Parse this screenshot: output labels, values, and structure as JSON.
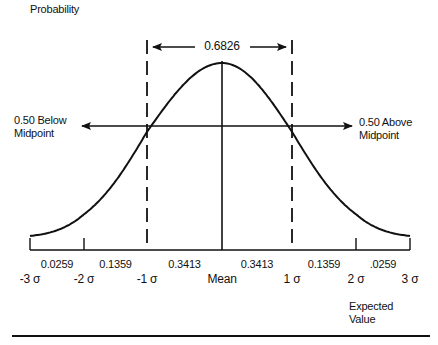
{
  "diagram": {
    "y_axis_label": "Probability",
    "x_axis_label_line1": "Expected",
    "x_axis_label_line2": "Value",
    "top_span_label": "0.6826",
    "left_annotation_line1": "0.50 Below",
    "left_annotation_line2": "Midpoint",
    "right_annotation_line1": "0.50 Above",
    "right_annotation_line2": "Midpoint",
    "stroke_color": "#111111",
    "background_color": "#ffffff"
  },
  "chart_data": {
    "type": "line",
    "title": "",
    "xlabel": "Expected Value",
    "ylabel": "Probability",
    "curve": "normal",
    "mean": 0,
    "std_dev": 1,
    "xlim": [
      -3,
      3
    ],
    "ticks": [
      {
        "value": -3,
        "label": "-3 σ"
      },
      {
        "value": -2,
        "label": "-2 σ"
      },
      {
        "value": -1,
        "label": "-1 σ"
      },
      {
        "value": 0,
        "label": "Mean"
      },
      {
        "value": 1,
        "label": "1 σ"
      },
      {
        "value": 2,
        "label": "2 σ"
      },
      {
        "value": 3,
        "label": "3 σ"
      }
    ],
    "interval_probabilities": [
      {
        "from": -3,
        "to": -2,
        "label": "0.0259"
      },
      {
        "from": -2,
        "to": -1,
        "label": "0.1359"
      },
      {
        "from": -1,
        "to": 0,
        "label": "0.3413"
      },
      {
        "from": 0,
        "to": 1,
        "label": "0.3413"
      },
      {
        "from": 1,
        "to": 2,
        "label": "0.1359"
      },
      {
        "from": 2,
        "to": 3,
        "label": ".0259"
      }
    ],
    "dashed_bounds": [
      -1,
      1
    ],
    "span_probability": "0.6826"
  }
}
